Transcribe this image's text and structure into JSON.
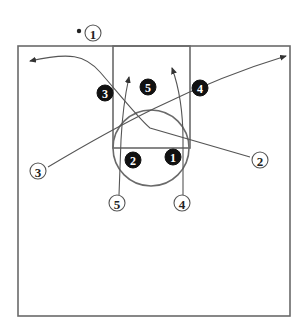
{
  "diagram": {
    "colors": {
      "court_line": "#6a6a6a",
      "path_line": "#555555",
      "offense_fill": "#ffffff",
      "defense_fill": "#111111"
    },
    "court": {
      "boundary": {
        "x": 18,
        "y": 46,
        "width": 272,
        "height": 270
      },
      "lane": {
        "x": 113,
        "y": 46,
        "width": 77,
        "height": 102
      },
      "free_throw_circle": {
        "cx": 151,
        "cy": 148,
        "r": 38
      }
    },
    "offense": [
      {
        "label": "1",
        "x": 93,
        "y": 33,
        "has_ball": true
      },
      {
        "label": "3",
        "x": 38,
        "y": 171
      },
      {
        "label": "2",
        "x": 260,
        "y": 160
      },
      {
        "label": "5",
        "x": 117,
        "y": 203
      },
      {
        "label": "4",
        "x": 182,
        "y": 203
      }
    ],
    "defense": [
      {
        "label": "3",
        "x": 105,
        "y": 93
      },
      {
        "label": "5",
        "x": 148,
        "y": 87
      },
      {
        "label": "4",
        "x": 200,
        "y": 88
      },
      {
        "label": "2",
        "x": 133,
        "y": 160
      },
      {
        "label": "1",
        "x": 173,
        "y": 157
      }
    ],
    "movements": [
      {
        "from": "2",
        "description": "2 cuts through lane to left wing"
      },
      {
        "from": "3",
        "description": "3 cuts across to right corner"
      },
      {
        "from": "5",
        "description": "5 cuts up into lane"
      },
      {
        "from": "4",
        "description": "4 cuts up into lane"
      }
    ]
  }
}
